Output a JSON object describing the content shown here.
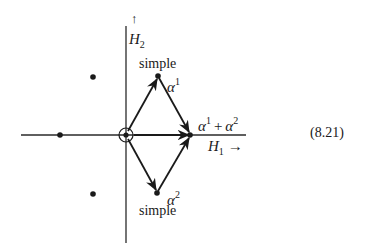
{
  "diagram": {
    "type": "root-diagram",
    "equation_number": "(8.21)",
    "axes": {
      "horizontal": {
        "label_var": "H",
        "label_sub": "1",
        "arrow": "→"
      },
      "vertical": {
        "label_var": "H",
        "label_sub": "2",
        "arrow": "↑"
      }
    },
    "roots": {
      "alpha1": {
        "greek": "α",
        "sup": "1",
        "tag": "simple"
      },
      "alpha2": {
        "greek": "α",
        "sup": "2",
        "tag": "simple"
      },
      "sum": {
        "greek1": "α",
        "sup1": "1",
        "plus": "+",
        "greek2": "α",
        "sup2": "2"
      }
    },
    "points": [
      {
        "name": "alpha1",
        "x": 158,
        "y": 76
      },
      {
        "name": "alpha2",
        "x": 157,
        "y": 193
      },
      {
        "name": "alpha1-plus-alpha2",
        "x": 190,
        "y": 135
      },
      {
        "name": "origin",
        "x": 126,
        "y": 135,
        "circled": true
      },
      {
        "name": "negative-sum",
        "x": 60,
        "y": 135
      },
      {
        "name": "upper-left",
        "x": 93,
        "y": 77
      },
      {
        "name": "lower-left",
        "x": 93,
        "y": 194
      }
    ],
    "arrows": [
      {
        "from": "origin",
        "to": "alpha1"
      },
      {
        "from": "origin",
        "to": "alpha2"
      },
      {
        "from": "alpha1",
        "to": "alpha1-plus-alpha2"
      },
      {
        "from": "alpha2",
        "to": "alpha1-plus-alpha2"
      }
    ],
    "colors": {
      "ink": "#1a1a1a",
      "background": "#ffffff"
    }
  }
}
